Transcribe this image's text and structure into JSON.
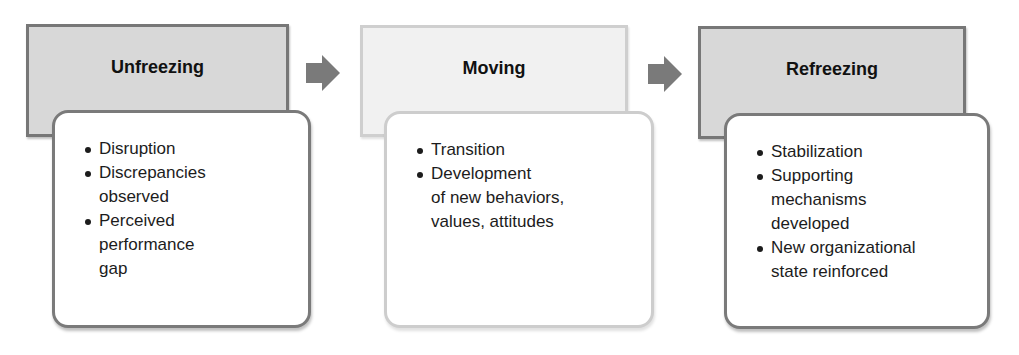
{
  "diagram": {
    "stages": [
      {
        "title": "Unfreezing",
        "style": "dark",
        "bullets": [
          "Disruption",
          "Discrepancies\nobserved",
          "Perceived\nperformance\ngap"
        ]
      },
      {
        "title": "Moving",
        "style": "light",
        "bullets": [
          "Transition",
          "Development\nof new behaviors,\nvalues, attitudes"
        ]
      },
      {
        "title": "Refreezing",
        "style": "dark",
        "bullets": [
          "Stabilization",
          "Supporting\nmechanisms\ndeveloped",
          "New organizational\nstate reinforced"
        ]
      }
    ],
    "arrows": [
      {
        "icon": "right-arrow-icon",
        "from": "Unfreezing",
        "to": "Moving"
      },
      {
        "icon": "right-arrow-icon",
        "from": "Moving",
        "to": "Refreezing"
      }
    ],
    "colors": {
      "header_dark_fill": "#d8d8d8",
      "header_light_fill": "#f1f1f1",
      "border_dark": "#777777",
      "border_light": "#cdcdcd",
      "arrow": "#7a7a7a",
      "text": "#1c1c1c"
    }
  }
}
